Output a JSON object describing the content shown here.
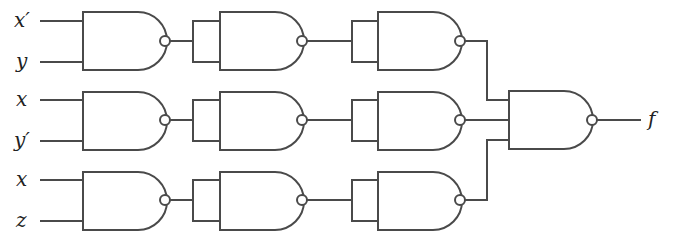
{
  "diagram": {
    "type": "logic-circuit",
    "gate_type": "NAND",
    "inputs": [
      {
        "label": "x′",
        "row": 1
      },
      {
        "label": "y",
        "row": 1
      },
      {
        "label": "x",
        "row": 2
      },
      {
        "label": "y′",
        "row": 2
      },
      {
        "label": "x",
        "row": 3
      },
      {
        "label": "z",
        "row": 3
      }
    ],
    "output": {
      "label": "f"
    },
    "columns": [
      {
        "name": "stage-1",
        "gates": [
          "NAND2(x', y)",
          "NAND2(x, y')",
          "NAND2(x, z)"
        ]
      },
      {
        "name": "stage-2 (inverter)",
        "gates": [
          "NAND(tied)",
          "NAND(tied)",
          "NAND(tied)"
        ]
      },
      {
        "name": "stage-3 (inverter)",
        "gates": [
          "NAND(tied)",
          "NAND(tied)",
          "NAND(tied)"
        ]
      },
      {
        "name": "output",
        "gates": [
          "NAND3"
        ]
      }
    ],
    "colors": {
      "line": "#4a4a4a",
      "background": "#ffffff",
      "text": "#222222"
    }
  }
}
